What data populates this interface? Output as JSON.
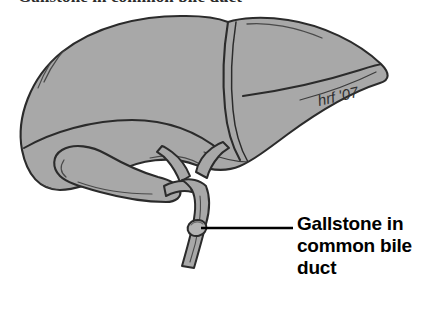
{
  "figure": {
    "title": "Gallstone in common bile duct",
    "title_visible_note": "cropped at top edge",
    "signature": "hrf '07",
    "colors": {
      "organ_fill": "#a8a8a8",
      "organ_fill_shadow": "#9a9a9a",
      "outline": "#2b2b2b",
      "stone_fill": "#b4b4b4",
      "leader_line": "#000000",
      "label_text": "#000000",
      "background": "#ffffff"
    },
    "annotation": {
      "label_lines": [
        "Gallstone in",
        "common bile",
        "duct"
      ],
      "leader_line": {
        "from_x": 201,
        "from_y": 228,
        "to_x": 293,
        "to_y": 228
      }
    },
    "anatomy": [
      {
        "name": "liver-right-lobe",
        "label": "Right lobe of liver"
      },
      {
        "name": "liver-left-lobe",
        "label": "Left lobe of liver"
      },
      {
        "name": "falciform-ligament",
        "label": "Falciform ligament notch"
      },
      {
        "name": "gallbladder",
        "label": "Gallbladder"
      },
      {
        "name": "cystic-duct",
        "label": "Cystic duct"
      },
      {
        "name": "hepatic-ducts",
        "label": "Right and left hepatic ducts"
      },
      {
        "name": "common-bile-duct",
        "label": "Common bile duct"
      },
      {
        "name": "gallstone",
        "label": "Gallstone",
        "x": 196,
        "y": 228
      }
    ]
  }
}
